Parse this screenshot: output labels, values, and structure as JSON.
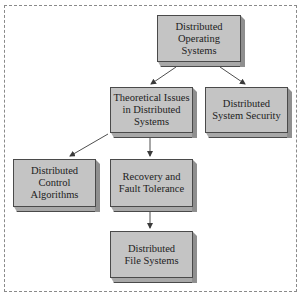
{
  "diagram": {
    "nodes": [
      {
        "id": "dos",
        "label": "Distributed Operating Systems",
        "lines": [
          "Distributed",
          "Operating",
          "Systems"
        ]
      },
      {
        "id": "theory",
        "label": "Theoretical Issues in Distributed Systems",
        "lines": [
          "Theoretical Issues",
          "in Distributed",
          "Systems"
        ]
      },
      {
        "id": "security",
        "label": "Distributed System Security",
        "lines": [
          "Distributed",
          "System Security"
        ]
      },
      {
        "id": "control",
        "label": "Distributed Control Algorithms",
        "lines": [
          "Distributed",
          "Control",
          "Algorithms"
        ]
      },
      {
        "id": "recovery",
        "label": "Recovery and Fault Tolerance",
        "lines": [
          "Recovery and",
          "Fault Tolerance"
        ]
      },
      {
        "id": "files",
        "label": "Distributed File Systems",
        "lines": [
          "Distributed",
          "File Systems"
        ]
      }
    ],
    "edges": [
      {
        "from": "dos",
        "to": "theory"
      },
      {
        "from": "dos",
        "to": "security"
      },
      {
        "from": "theory",
        "to": "control"
      },
      {
        "from": "theory",
        "to": "recovery"
      },
      {
        "from": "recovery",
        "to": "files"
      }
    ],
    "colors": {
      "box_face": "#c4c4c4",
      "box_side": "#8f8f8f",
      "box_bottom": "#a8a8a8",
      "outline": "#4a4a4a",
      "arrow": "#3a3a3a",
      "frame": "#8a8a8a"
    }
  }
}
